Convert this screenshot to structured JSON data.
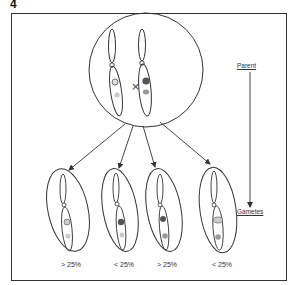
{
  "figure": {
    "number": "4",
    "parent_label": "Parent",
    "gametes_label": "Gametes",
    "cross_symbol": "×"
  },
  "parent_cell": {
    "chromosomes": [
      {
        "side": "left",
        "band_upper": "open-circle",
        "band_lower": "light-gray"
      },
      {
        "side": "right",
        "band_upper": "dark-filled",
        "band_lower": "medium-gray"
      }
    ]
  },
  "gametes": [
    {
      "label": "> 25%",
      "band_upper": "open-circle",
      "band_lower": "light-gray"
    },
    {
      "label": "< 25%",
      "band_upper": "dark-filled",
      "band_lower": "light-gray"
    },
    {
      "label": "> 25%",
      "band_upper": "dark-filled",
      "band_lower": "medium-gray"
    },
    {
      "label": "< 25%",
      "band_upper": "open-circle",
      "band_lower": "medium-gray"
    }
  ],
  "colors": {
    "line": "#333333",
    "dark_band": "#555555",
    "medium_band": "#999999",
    "light_band": "#c8c8c8"
  }
}
